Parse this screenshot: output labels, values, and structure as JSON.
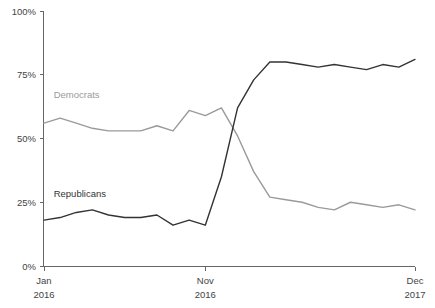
{
  "chart_data": {
    "type": "line",
    "title": "",
    "subtitle": "",
    "xlabel": "",
    "ylabel": "",
    "ylim": [
      0,
      100
    ],
    "grid": false,
    "legend_position": "inline-labels",
    "y_ticks": [
      "0%",
      "25%",
      "50%",
      "75%",
      "100%"
    ],
    "y_tick_values": [
      0,
      25,
      50,
      75,
      100
    ],
    "x_ticks": [
      {
        "label": "Jan",
        "sublabel": "2016",
        "index": 0
      },
      {
        "label": "Nov",
        "sublabel": "2016",
        "index": 10
      },
      {
        "label": "Dec",
        "sublabel": "2017",
        "index": 23
      }
    ],
    "x_index_range": [
      0,
      23
    ],
    "series": [
      {
        "name": "Democrats",
        "color": "#9a9a9a",
        "label_x_index": 0.6,
        "label_y_value": 66,
        "values": [
          56,
          58,
          56,
          54,
          53,
          53,
          53,
          55,
          53,
          61,
          59,
          62,
          51,
          37,
          27,
          26,
          25,
          23,
          22,
          25,
          24,
          23,
          24,
          22
        ]
      },
      {
        "name": "Republicans",
        "color": "#333333",
        "label_x_index": 0.6,
        "label_y_value": 27,
        "values": [
          18,
          19,
          21,
          22,
          20,
          19,
          19,
          20,
          16,
          18,
          16,
          35,
          62,
          73,
          80,
          80,
          79,
          78,
          79,
          78,
          77,
          79,
          78,
          81
        ]
      }
    ]
  },
  "plot_geometry": {
    "left": 44,
    "right": 415,
    "top": 11,
    "bottom": 266
  }
}
